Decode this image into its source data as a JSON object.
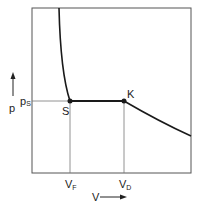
{
  "diagram": {
    "type": "p-V phase diagram",
    "y_axis_label": "p",
    "x_axis_label": "V",
    "pressure_label": "p",
    "pressure_sub": "S",
    "points": [
      {
        "id": "S",
        "label": "S"
      },
      {
        "id": "K",
        "label": "K"
      }
    ],
    "x_ticks": [
      {
        "main": "V",
        "sub": "F"
      },
      {
        "main": "V",
        "sub": "D"
      }
    ],
    "colors": {
      "curve": "#1a1a1a",
      "frame": "#555555",
      "guides": "#777777"
    }
  }
}
